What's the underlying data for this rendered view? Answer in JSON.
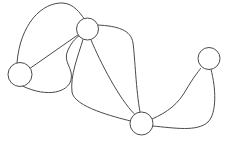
{
  "diagram": {
    "type": "undirected-multigraph",
    "canvas": {
      "width": 227,
      "height": 146,
      "background": "#ffffff"
    },
    "style": {
      "edge_color": "#4a4a4a",
      "edge_width": 1,
      "node_stroke": "#4a4a4a",
      "node_fill": "#ffffff",
      "node_stroke_width": 1
    },
    "nodes": [
      {
        "id": "n1",
        "label": "",
        "name": "node-left",
        "cx": 20,
        "cy": 74.5,
        "r": 12
      },
      {
        "id": "n2",
        "label": "",
        "name": "node-top-middle",
        "cx": 87.5,
        "cy": 29,
        "r": 11
      },
      {
        "id": "n3",
        "label": "",
        "name": "node-bottom-middle",
        "cx": 141.5,
        "cy": 123.5,
        "r": 11.5
      },
      {
        "id": "n4",
        "label": "",
        "name": "node-right",
        "cx": 209,
        "cy": 58.5,
        "r": 11
      }
    ],
    "edges": [
      {
        "id": "e1",
        "name": "edge-left-top-arc-over",
        "from": "n1",
        "to": "n2",
        "d": "M 17,62.8 C 20,24 42,2 63,3 C 74,4 80,13 84,18.5"
      },
      {
        "id": "e2",
        "name": "edge-left-top-straight",
        "from": "n1",
        "to": "n2",
        "d": "M 30.5,68 L 78.5,34.5"
      },
      {
        "id": "e3",
        "name": "edge-left-top-lower-loop",
        "from": "n1",
        "to": "n2",
        "d": "M 23,86.3 C 48,98 68,92 71,80 C 74,68 62,62 68,50 C 72,41 78,36 79.8,35.5"
      },
      {
        "id": "e4",
        "name": "edge-top-bottom-left-curve",
        "from": "n2",
        "to": "n3",
        "d": "M 83,39.5 C 78,56 70,76 72,92 C 74,107 115,117 130.5,121"
      },
      {
        "id": "e5",
        "name": "edge-top-bottom-straight",
        "from": "n2",
        "to": "n3",
        "d": "M 91,39.8 C 100,62 120,100 134,113.5"
      },
      {
        "id": "e6",
        "name": "edge-top-bottom-right-curve",
        "from": "n2",
        "to": "n3",
        "d": "M 97.5,25 C 118,26 131,30 133,43 C 135,58 136,90 140,112"
      },
      {
        "id": "e7",
        "name": "edge-bottom-right-upper",
        "from": "n3",
        "to": "n4",
        "d": "M 152,119 C 168,112 178,104 186,90 C 193,78 198,72 200.5,68.5"
      },
      {
        "id": "e8",
        "name": "edge-bottom-right-lower",
        "from": "n3",
        "to": "n4",
        "d": "M 152.5,126 C 175,128 197,132 208,122 C 217,113 216,88 211,69.5"
      }
    ],
    "legend": {
      "node_count": 4,
      "edge_count": 8
    }
  }
}
